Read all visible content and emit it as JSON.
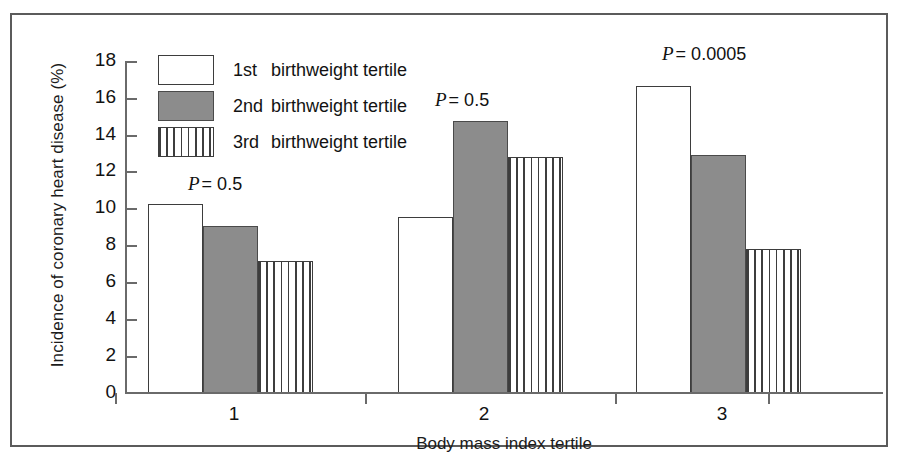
{
  "chart_data": {
    "type": "bar",
    "title": "",
    "xlabel": "Body mass index tertile",
    "ylabel": "Incidence of coronary heart disease (%)",
    "categories": [
      "1",
      "2",
      "3"
    ],
    "ylim": [
      0,
      18
    ],
    "yticks": [
      0,
      2,
      4,
      6,
      8,
      10,
      12,
      14,
      16,
      18
    ],
    "ytick_labels": [
      "0",
      "2",
      "4",
      "6",
      "8",
      "10",
      "12",
      "14",
      "16",
      "18"
    ],
    "grid": false,
    "legend_position": "upper-left-inside",
    "series": [
      {
        "name": "1st  birthweight tertile",
        "ordinal": "1st",
        "label_rest": "birthweight tertile",
        "style": "open",
        "values": [
          10.2,
          9.5,
          16.65
        ]
      },
      {
        "name": "2nd birthweight tertile",
        "ordinal": "2nd",
        "label_rest": "birthweight tertile",
        "style": "solid",
        "values": [
          9.05,
          14.75,
          12.9
        ]
      },
      {
        "name": "3rd  birthweight tertile",
        "ordinal": "3rd",
        "label_rest": "birthweight tertile",
        "style": "hatch",
        "values": [
          7.15,
          12.8,
          7.75
        ]
      }
    ],
    "annotations": [
      {
        "text": "P = 0.5",
        "p_symbol": "P",
        "rest": "= 0.5",
        "group": "1"
      },
      {
        "text": "P = 0.5",
        "p_symbol": "P",
        "rest": "= 0.5",
        "group": "2"
      },
      {
        "text": "P = 0.0005",
        "p_symbol": "P",
        "rest": "= 0.0005",
        "group": "3"
      }
    ],
    "colors": {
      "open_fill": "#ffffff",
      "solid_fill": "#8c8c8c",
      "hatch_fill": "#ffffff",
      "outline": "#3d3d3d",
      "axis": "#6a6a6a",
      "text": "#121212",
      "frame": "#5b5b5b",
      "background": "#ffffff"
    }
  },
  "axis": {
    "ylabel": "Incidence of coronary heart disease (%)",
    "xlabel": "Body mass index tertile",
    "ytick_0": "0",
    "ytick_1": "2",
    "ytick_2": "4",
    "ytick_3": "6",
    "ytick_4": "8",
    "ytick_5": "10",
    "ytick_6": "12",
    "ytick_7": "14",
    "ytick_8": "16",
    "ytick_9": "18",
    "xtick_0": "1",
    "xtick_1": "2",
    "xtick_2": "3"
  },
  "legend": {
    "rows": [
      {
        "ordinal": "1st",
        "text": "birthweight tertile"
      },
      {
        "ordinal": "2nd",
        "text": "birthweight tertile"
      },
      {
        "ordinal": "3rd",
        "text": "birthweight tertile"
      }
    ]
  },
  "pvalues": {
    "group1_symbol": "P",
    "group1_rest": "= 0.5",
    "group2_symbol": "P",
    "group2_rest": "= 0.5",
    "group3_symbol": "P",
    "group3_rest": "= 0.0005"
  }
}
